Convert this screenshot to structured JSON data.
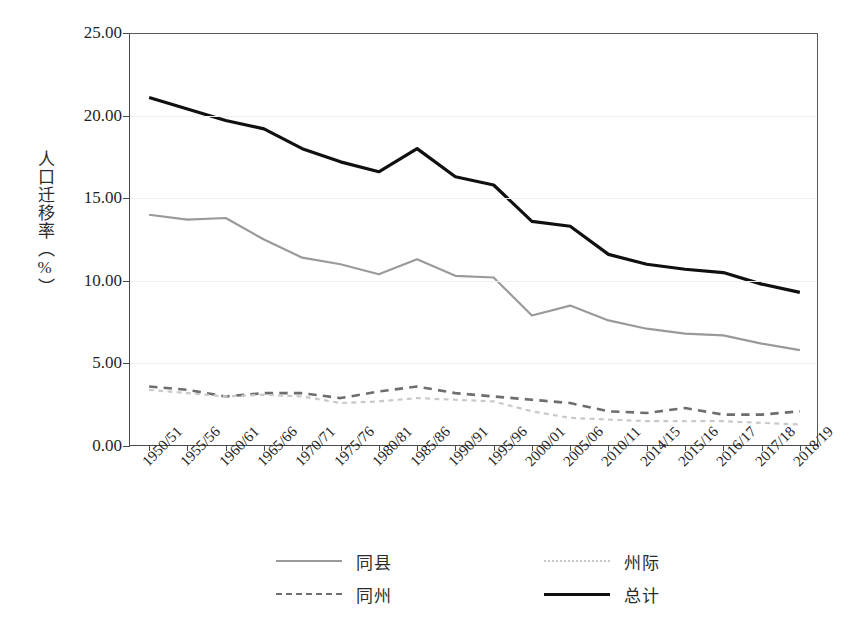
{
  "chart_data": {
    "type": "line",
    "title": "",
    "xlabel": "",
    "ylabel": "人口迁移率（%）",
    "ylim": [
      0,
      25
    ],
    "ytick_step": 5,
    "ytick_labels": [
      "0.00",
      "5.00",
      "10.00",
      "15.00",
      "20.00",
      "25.00"
    ],
    "grid": true,
    "legend_position": "bottom",
    "categories": [
      "1950/51",
      "1955/56",
      "1960/61",
      "1965/66",
      "1970/71",
      "1975/76",
      "1980/81",
      "1985/86",
      "1990/91",
      "1995/96",
      "2000/01",
      "2005/06",
      "2010/11",
      "2014/15",
      "2015/16",
      "2016/17",
      "2017/18",
      "2018/19"
    ],
    "series": [
      {
        "name": "同县",
        "style": "solid",
        "color": "#9a9a9a",
        "values": [
          14.0,
          13.7,
          13.8,
          12.5,
          11.4,
          11.0,
          10.4,
          11.3,
          10.3,
          10.2,
          7.9,
          8.5,
          7.6,
          7.1,
          6.8,
          6.7,
          6.2,
          5.8
        ]
      },
      {
        "name": "同州",
        "style": "dashed",
        "color": "#6e6e6e",
        "values": [
          3.6,
          3.4,
          3.0,
          3.2,
          3.2,
          2.9,
          3.3,
          3.6,
          3.2,
          3.0,
          2.8,
          2.6,
          2.1,
          2.0,
          2.3,
          1.9,
          1.9,
          2.1
        ]
      },
      {
        "name": "州际",
        "style": "dotted",
        "color": "#c9c9c9",
        "values": [
          3.4,
          3.2,
          3.0,
          3.1,
          3.0,
          2.6,
          2.7,
          2.9,
          2.8,
          2.7,
          2.1,
          1.7,
          1.6,
          1.5,
          1.5,
          1.5,
          1.4,
          1.3
        ]
      },
      {
        "name": "总计",
        "style": "solid",
        "color": "#101010",
        "values": [
          21.1,
          20.4,
          19.7,
          19.2,
          18.0,
          17.2,
          16.6,
          18.0,
          16.3,
          15.8,
          13.6,
          13.3,
          11.6,
          11.0,
          10.7,
          10.5,
          9.8,
          9.3
        ]
      }
    ]
  },
  "legend": {
    "items": [
      {
        "label": "同县",
        "style": "solid",
        "color": "#9a9a9a"
      },
      {
        "label": "同州",
        "style": "dashed",
        "color": "#6e6e6e"
      },
      {
        "label": "州际",
        "style": "dotted",
        "color": "#c9c9c9"
      },
      {
        "label": "总计",
        "style": "solid",
        "color": "#101010"
      }
    ]
  }
}
